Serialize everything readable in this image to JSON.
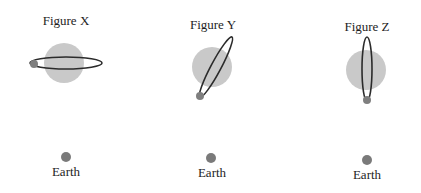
{
  "figures": [
    {
      "label": "Figure X",
      "label_pos": [
        66,
        14
      ],
      "sun": {
        "cx": 64,
        "cy": 63,
        "r": 20
      },
      "orbit": {
        "cx": 66,
        "cy": 63,
        "rx": 36,
        "ry": 6,
        "rotate": 0
      },
      "body": {
        "cx": 34,
        "cy": 64,
        "r": 4
      },
      "earth": {
        "cx": 66,
        "cy": 157,
        "r": 5,
        "label": "Earth",
        "label_pos": [
          66,
          165
        ]
      }
    },
    {
      "label": "Figure Y",
      "label_pos": [
        213,
        18
      ],
      "sun": {
        "cx": 212,
        "cy": 67,
        "r": 20
      },
      "orbit": {
        "cx": 216,
        "cy": 67,
        "rx": 34,
        "ry": 5,
        "rotate": -62
      },
      "body": {
        "cx": 200,
        "cy": 96,
        "r": 4
      },
      "earth": {
        "cx": 211,
        "cy": 158,
        "r": 5,
        "label": "Earth",
        "label_pos": [
          212,
          166
        ]
      }
    },
    {
      "label": "Figure Z",
      "label_pos": [
        367,
        20
      ],
      "sun": {
        "cx": 366,
        "cy": 70,
        "r": 20
      },
      "orbit": {
        "cx": 367,
        "cy": 69,
        "rx": 32,
        "ry": 5,
        "rotate": 90
      },
      "body": {
        "cx": 367,
        "cy": 100,
        "r": 4
      },
      "earth": {
        "cx": 367,
        "cy": 160,
        "r": 5,
        "label": "Earth",
        "label_pos": [
          367,
          168
        ]
      }
    }
  ],
  "colors": {
    "sun": "#c9c9c9",
    "orbit": "#2b2b2b",
    "body": "#7f7f7f",
    "earth": "#7a7a7a"
  }
}
